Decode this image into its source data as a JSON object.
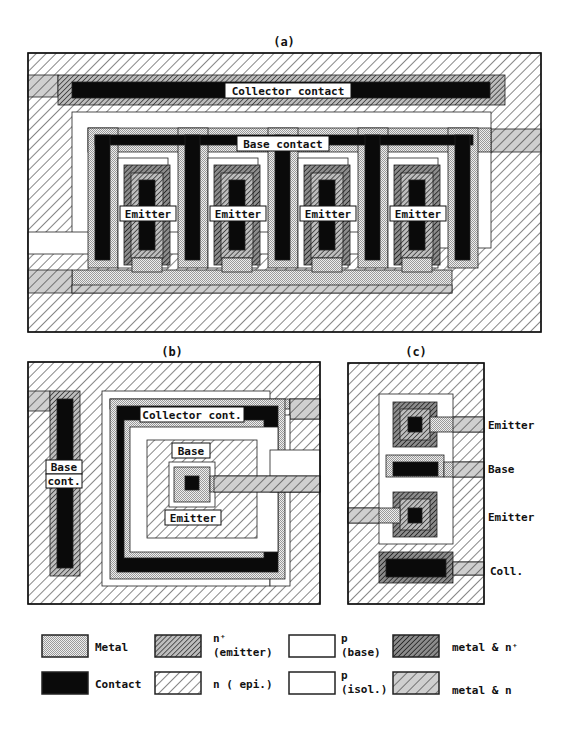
{
  "figure": {
    "panels": [
      {
        "id": "a",
        "caption": "(a)",
        "caption_pos": [
          284,
          46
        ],
        "frame": [
          28,
          53,
          513,
          279
        ],
        "shapes": [
          {
            "fill": "n",
            "rect": [
              28,
              53,
              513,
              279
            ]
          },
          {
            "fill": "metaln",
            "rect": [
              28,
              75,
              30,
              22
            ]
          },
          {
            "fill": "nplus",
            "rect": [
              58,
              75,
              447,
              30
            ]
          },
          {
            "fill": "contact",
            "rect": [
              72,
              82,
              418,
              16
            ]
          },
          {
            "fill": "p",
            "rect": [
              72,
              112,
              419,
              136
            ]
          },
          {
            "fill": "metaln",
            "rect": [
              491,
              129,
              50,
              23
            ]
          },
          {
            "fill": "p",
            "rect": [
              28,
              232,
              402,
              22
            ]
          },
          {
            "fill": "metal",
            "rect": [
              88,
              128,
              403,
              24
            ]
          },
          {
            "fill": "metal",
            "rect": [
              88,
              128,
              30,
              140
            ]
          },
          {
            "fill": "metal",
            "rect": [
              178,
              128,
              30,
              140
            ]
          },
          {
            "fill": "metal",
            "rect": [
              268,
              128,
              30,
              140
            ]
          },
          {
            "fill": "metal",
            "rect": [
              358,
              128,
              30,
              140
            ]
          },
          {
            "fill": "metal",
            "rect": [
              448,
              128,
              30,
              140
            ]
          },
          {
            "fill": "contact",
            "rect": [
              95,
              135,
              378,
              10
            ]
          },
          {
            "fill": "contact",
            "rect": [
              95,
              135,
              15,
              125
            ]
          },
          {
            "fill": "contact",
            "rect": [
              185,
              135,
              15,
              125
            ]
          },
          {
            "fill": "contact",
            "rect": [
              275,
              135,
              15,
              125
            ]
          },
          {
            "fill": "contact",
            "rect": [
              365,
              135,
              15,
              125
            ]
          },
          {
            "fill": "contact",
            "rect": [
              455,
              135,
              15,
              125
            ]
          },
          {
            "fill": "metal",
            "rect": [
              72,
              270,
              380,
              23
            ]
          },
          {
            "fill": "metaln",
            "rect": [
              28,
              270,
              44,
              23
            ]
          },
          {
            "fill": "metaln",
            "rect": [
              72,
              285,
              380,
              8
            ]
          },
          {
            "fill": "p",
            "rect": [
              118,
              158,
              50,
              110
            ]
          },
          {
            "fill": "p",
            "rect": [
              208,
              158,
              50,
              110
            ]
          },
          {
            "fill": "p",
            "rect": [
              298,
              158,
              50,
              110
            ]
          },
          {
            "fill": "p",
            "rect": [
              388,
              158,
              50,
              110
            ]
          },
          {
            "fill": "metalnplus",
            "rect": [
              124,
              165,
              46,
              100
            ]
          },
          {
            "fill": "metalnplus",
            "rect": [
              214,
              165,
              46,
              100
            ]
          },
          {
            "fill": "metalnplus",
            "rect": [
              304,
              165,
              46,
              100
            ]
          },
          {
            "fill": "metalnplus",
            "rect": [
              394,
              165,
              46,
              100
            ]
          },
          {
            "fill": "nplus",
            "rect": [
              131,
              173,
              32,
              85
            ]
          },
          {
            "fill": "nplus",
            "rect": [
              221,
              173,
              32,
              85
            ]
          },
          {
            "fill": "nplus",
            "rect": [
              311,
              173,
              32,
              85
            ]
          },
          {
            "fill": "nplus",
            "rect": [
              401,
              173,
              32,
              85
            ]
          },
          {
            "fill": "contact",
            "rect": [
              139,
              180,
              16,
              70
            ]
          },
          {
            "fill": "contact",
            "rect": [
              229,
              180,
              16,
              70
            ]
          },
          {
            "fill": "contact",
            "rect": [
              319,
              180,
              16,
              70
            ]
          },
          {
            "fill": "contact",
            "rect": [
              409,
              180,
              16,
              70
            ]
          },
          {
            "fill": "metal",
            "rect": [
              132,
              258,
              30,
              14
            ]
          },
          {
            "fill": "metal",
            "rect": [
              222,
              258,
              30,
              14
            ]
          },
          {
            "fill": "metal",
            "rect": [
              312,
              258,
              30,
              14
            ]
          },
          {
            "fill": "metal",
            "rect": [
              402,
              258,
              30,
              14
            ]
          }
        ],
        "labels": [
          {
            "text": "Collector contact",
            "x": 225,
            "y": 83,
            "w": 126,
            "h": 15,
            "fs": 11
          },
          {
            "text": "Base contact",
            "x": 237,
            "y": 136,
            "w": 92,
            "h": 15,
            "fs": 11
          },
          {
            "text": "Emitter",
            "x": 120,
            "y": 206,
            "w": 56,
            "h": 15,
            "fs": 11
          },
          {
            "text": "Emitter",
            "x": 210,
            "y": 206,
            "w": 56,
            "h": 15,
            "fs": 11
          },
          {
            "text": "Emitter",
            "x": 300,
            "y": 206,
            "w": 56,
            "h": 15,
            "fs": 11
          },
          {
            "text": "Emitter",
            "x": 390,
            "y": 206,
            "w": 56,
            "h": 15,
            "fs": 11
          }
        ]
      },
      {
        "id": "b",
        "caption": "(b)",
        "caption_pos": [
          172,
          356
        ],
        "frame": [
          28,
          362,
          292,
          242
        ],
        "shapes": [
          {
            "fill": "n",
            "rect": [
              28,
              362,
              292,
              242
            ]
          },
          {
            "fill": "metaln",
            "rect": [
              28,
              391,
              22,
              20
            ]
          },
          {
            "fill": "nplus",
            "rect": [
              50,
              391,
              30,
              185
            ]
          },
          {
            "fill": "contact",
            "rect": [
              57,
              399,
              16,
              169
            ]
          },
          {
            "fill": "p",
            "rect": [
              102,
              391,
              168,
              195
            ]
          },
          {
            "fill": "metal",
            "rect": [
              110,
              399,
              180,
              10
            ]
          },
          {
            "fill": "metal",
            "rect": [
              290,
              399,
              30,
              20
            ]
          },
          {
            "fill": "metaln",
            "rect": [
              290,
              399,
              30,
              20
            ]
          },
          {
            "fill": "p",
            "rect": [
              270,
              415,
              20,
              171
            ]
          },
          {
            "fill": "metal",
            "rect": [
              110,
              399,
              175,
              180
            ]
          },
          {
            "fill": "contact",
            "rect": [
              117,
              406,
              161,
              166
            ]
          },
          {
            "fill": "metal",
            "rect": [
              124,
              420,
              140,
              138
            ]
          },
          {
            "fill": "p",
            "rect": [
              130,
              427,
              148,
              125
            ]
          },
          {
            "fill": "p",
            "rect": [
              270,
              450,
              50,
              42
            ]
          },
          {
            "fill": "n",
            "rect": [
              147,
              440,
              110,
              98
            ]
          },
          {
            "fill": "p",
            "rect": [
              169,
              462,
              46,
              45
            ]
          },
          {
            "fill": "metal",
            "rect": [
              174,
              467,
              36,
              35
            ]
          },
          {
            "fill": "metal",
            "rect": [
              210,
              476,
              110,
              16
            ]
          },
          {
            "fill": "metaln",
            "rect": [
              214,
              476,
              106,
              16
            ]
          },
          {
            "fill": "contact",
            "rect": [
              185,
              476,
              14,
              14
            ]
          }
        ],
        "labels": [
          {
            "text": "Collector cont.",
            "x": 140,
            "y": 407,
            "w": 104,
            "h": 15,
            "fs": 11
          },
          {
            "text": "Base",
            "x": 172,
            "y": 443,
            "w": 38,
            "h": 15,
            "fs": 11
          },
          {
            "text": "Emitter",
            "x": 165,
            "y": 510,
            "w": 56,
            "h": 15,
            "fs": 11
          },
          {
            "text": "Base",
            "x": 46,
            "y": 460,
            "w": 36,
            "h": 14,
            "fs": 11
          },
          {
            "text": "cont.",
            "x": 46,
            "y": 474,
            "w": 36,
            "h": 14,
            "fs": 11
          }
        ]
      },
      {
        "id": "c",
        "caption": "(c)",
        "caption_pos": [
          416,
          356
        ],
        "frame": [
          348,
          363,
          136,
          241
        ],
        "shapes": [
          {
            "fill": "n",
            "rect": [
              348,
              363,
              136,
              241
            ]
          },
          {
            "fill": "p",
            "rect": [
              379,
              394,
              74,
              150
            ]
          },
          {
            "fill": "metalnplus",
            "rect": [
              393,
              402,
              44,
              45
            ]
          },
          {
            "fill": "nplus",
            "rect": [
              400,
              409,
              30,
              31
            ]
          },
          {
            "fill": "contact",
            "rect": [
              408,
              417,
              14,
              15
            ]
          },
          {
            "fill": "metal",
            "rect": [
              430,
              417,
              54,
              15
            ]
          },
          {
            "fill": "metaln",
            "rect": [
              453,
              417,
              31,
              15
            ]
          },
          {
            "fill": "metal",
            "rect": [
              386,
              455,
              58,
              22
            ]
          },
          {
            "fill": "metal",
            "rect": [
              444,
              462,
              40,
              15
            ]
          },
          {
            "fill": "metaln",
            "rect": [
              453,
              462,
              31,
              15
            ]
          },
          {
            "fill": "contact",
            "rect": [
              393,
              462,
              45,
              14
            ]
          },
          {
            "fill": "metalnplus",
            "rect": [
              393,
              492,
              44,
              45
            ]
          },
          {
            "fill": "nplus",
            "rect": [
              400,
              499,
              30,
              31
            ]
          },
          {
            "fill": "contact",
            "rect": [
              408,
              508,
              14,
              15
            ]
          },
          {
            "fill": "metal",
            "rect": [
              348,
              508,
              52,
              15
            ]
          },
          {
            "fill": "metaln",
            "rect": [
              348,
              508,
              31,
              15
            ]
          },
          {
            "fill": "metalnplus",
            "rect": [
              379,
              552,
              74,
              31
            ]
          },
          {
            "fill": "contact",
            "rect": [
              386,
              559,
              60,
              18
            ]
          },
          {
            "fill": "metal",
            "rect": [
              453,
              562,
              31,
              13
            ]
          },
          {
            "fill": "metaln",
            "rect": [
              453,
              562,
              31,
              13
            ]
          }
        ],
        "labels": [],
        "side_labels": [
          {
            "text": "Emitter",
            "x": 488,
            "y": 429,
            "fs": 11
          },
          {
            "text": "Base",
            "x": 488,
            "y": 473,
            "fs": 11
          },
          {
            "text": "Emitter",
            "x": 488,
            "y": 521,
            "fs": 11
          },
          {
            "text": "Coll.",
            "x": 490,
            "y": 575,
            "fs": 11
          }
        ]
      }
    ]
  },
  "legend": {
    "items": [
      {
        "swatch": "metal",
        "x": 42,
        "y": 635,
        "w": 46,
        "h": 22,
        "label_lines": [
          "Metal"
        ],
        "lx": 95,
        "ly": 651
      },
      {
        "swatch": "contact",
        "x": 42,
        "y": 672,
        "w": 46,
        "h": 22,
        "label_lines": [
          "Contact"
        ],
        "lx": 95,
        "ly": 688
      },
      {
        "swatch": "nplus",
        "x": 155,
        "y": 635,
        "w": 46,
        "h": 22,
        "label_lines": [
          "n⁺",
          "(emitter)"
        ],
        "lx": 213,
        "ly": 642
      },
      {
        "swatch": "n",
        "x": 155,
        "y": 672,
        "w": 46,
        "h": 22,
        "label_lines": [
          "n ( epi.)"
        ],
        "lx": 213,
        "ly": 688
      },
      {
        "swatch": "p",
        "x": 289,
        "y": 635,
        "w": 46,
        "h": 22,
        "label_lines": [
          "p",
          "(base)"
        ],
        "lx": 341,
        "ly": 642
      },
      {
        "swatch": "p",
        "x": 289,
        "y": 672,
        "w": 46,
        "h": 22,
        "label_lines": [
          "p",
          "(isol.)"
        ],
        "lx": 341,
        "ly": 679
      },
      {
        "swatch": "metalnplus",
        "x": 393,
        "y": 635,
        "w": 46,
        "h": 22,
        "label_lines": [
          "metal & n⁺"
        ],
        "lx": 452,
        "ly": 651
      },
      {
        "swatch": "metaln",
        "x": 393,
        "y": 672,
        "w": 46,
        "h": 22,
        "label_lines": [
          "metal & n"
        ],
        "lx": 452,
        "ly": 694
      }
    ]
  },
  "colors": {
    "ink": "#111111",
    "contact": "#0a0a0a",
    "background": "#ffffff"
  }
}
